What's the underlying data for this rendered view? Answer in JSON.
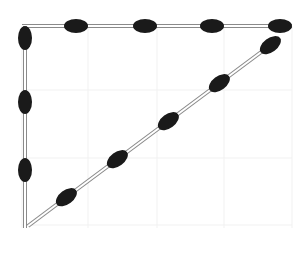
{
  "diagram": {
    "type": "matchstick-puzzle",
    "shape": "right-triangle",
    "width": 303,
    "height": 253,
    "colors": {
      "background": "#ffffff",
      "grid": "#f1f1f1",
      "stick_outline": "#8a8a8a",
      "stick_fill": "#ffffff",
      "head": "#1a1a1a"
    },
    "grid": {
      "x": [
        22,
        88,
        157,
        224,
        292
      ],
      "y": [
        26,
        90,
        158,
        225
      ],
      "x_range": [
        22,
        292
      ],
      "y_range": [
        26,
        228
      ]
    },
    "matchsticks": [
      {
        "id": "top-1",
        "side": "top",
        "x1": 22,
        "y1": 26,
        "x2": 88,
        "y2": 26,
        "head": "end"
      },
      {
        "id": "top-2",
        "side": "top",
        "x1": 88,
        "y1": 26,
        "x2": 157,
        "y2": 26,
        "head": "end"
      },
      {
        "id": "top-3",
        "side": "top",
        "x1": 157,
        "y1": 26,
        "x2": 224,
        "y2": 26,
        "head": "end"
      },
      {
        "id": "top-4",
        "side": "top",
        "x1": 224,
        "y1": 26,
        "x2": 292,
        "y2": 26,
        "head": "end"
      },
      {
        "id": "left-1",
        "side": "left",
        "x1": 25,
        "y1": 26,
        "x2": 25,
        "y2": 90,
        "head": "start"
      },
      {
        "id": "left-2",
        "side": "left",
        "x1": 25,
        "y1": 90,
        "x2": 25,
        "y2": 158,
        "head": "start"
      },
      {
        "id": "left-3",
        "side": "left",
        "x1": 25,
        "y1": 158,
        "x2": 25,
        "y2": 228,
        "head": "start"
      },
      {
        "id": "diag-1",
        "side": "hypotenuse",
        "x1": 28,
        "y1": 226,
        "x2": 76,
        "y2": 190,
        "head": "end"
      },
      {
        "id": "diag-2",
        "side": "hypotenuse",
        "x1": 76,
        "y1": 190,
        "x2": 127,
        "y2": 152,
        "head": "end"
      },
      {
        "id": "diag-3",
        "side": "hypotenuse",
        "x1": 127,
        "y1": 152,
        "x2": 178,
        "y2": 114,
        "head": "end"
      },
      {
        "id": "diag-4",
        "side": "hypotenuse",
        "x1": 178,
        "y1": 114,
        "x2": 229,
        "y2": 76,
        "head": "end"
      },
      {
        "id": "diag-5",
        "side": "hypotenuse",
        "x1": 229,
        "y1": 76,
        "x2": 280,
        "y2": 38,
        "head": "end"
      }
    ],
    "counts": {
      "top": 4,
      "left": 3,
      "hypotenuse": 5,
      "total": 12
    }
  }
}
